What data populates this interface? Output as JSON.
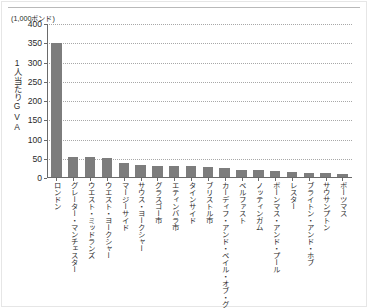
{
  "chart_data": {
    "type": "bar",
    "title": "",
    "unit_label": "(1,000ポンド)",
    "ylabel": "1人当たりGVA",
    "xlabel": "",
    "ylim": [
      0,
      400
    ],
    "yticks": [
      0,
      50,
      100,
      150,
      200,
      250,
      300,
      350,
      400
    ],
    "ytick_labels": [
      "0",
      "50",
      "100",
      "150",
      "200",
      "250",
      "300",
      "350",
      "400"
    ],
    "grid": true,
    "grid_axis": "y",
    "legend": false,
    "bar_color": "#7d7d7d",
    "categories": [
      "ロンドン",
      "グレーター・マンチェスター",
      "ウエスト・ミッドランズ",
      "ウエスト・ヨークシャー",
      "マージーサイド",
      "サウス・ヨークシャー",
      "グラスゴー市",
      "エティンバラ市",
      "タインサイド",
      "ブリストル市",
      "カーディフ・アンド・ベイル・オブ・グルモーゲン",
      "ベルファスト",
      "ノッティンガム",
      "ボーンマス・アンド・プール",
      "レスター",
      "ブライトン・アンド・ホブ",
      "サウサンプトン",
      "ポーツマス"
    ],
    "values": [
      350,
      55,
      55,
      51,
      38,
      34,
      32,
      32,
      30,
      29,
      25,
      22,
      20,
      17,
      15,
      13,
      12,
      10
    ]
  }
}
